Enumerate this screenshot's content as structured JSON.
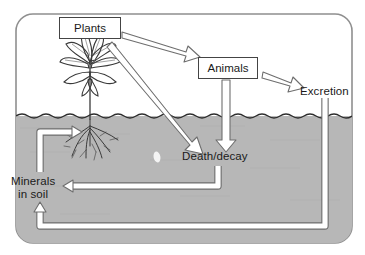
{
  "diagram": {
    "colors": {
      "soil": "#b7b7b7",
      "sky": "#ffffff",
      "frame": "#8a8a8a",
      "outline": "#4a4a4a",
      "text": "#1a1a1a",
      "arrow_fill": "#ffffff",
      "arrow_stroke": "#6e6e6e"
    },
    "nodes": [
      {
        "id": "plants",
        "label": "Plants",
        "type": "box",
        "x": 59,
        "y": 17,
        "w": 62,
        "h": 22
      },
      {
        "id": "animals",
        "label": "Animals",
        "type": "box",
        "x": 198,
        "y": 57,
        "w": 60,
        "h": 22
      },
      {
        "id": "excretion",
        "label": "Excretion",
        "type": "plain",
        "x": 300,
        "y": 85
      },
      {
        "id": "death",
        "label": "Death/decay",
        "type": "plain",
        "x": 182,
        "y": 150
      },
      {
        "id": "minerals",
        "label": "Minerals\nin soil",
        "line1": "Minerals",
        "line2": "in soil",
        "type": "plain",
        "x": 11,
        "y": 175
      }
    ],
    "edges": [
      {
        "id": "plants-to-animals",
        "from": "plants",
        "to": "animals",
        "style": "open-arrow-diagonal"
      },
      {
        "id": "plants-to-death",
        "from": "plants",
        "to": "death",
        "style": "open-arrow-diagonal"
      },
      {
        "id": "animals-to-death",
        "from": "animals",
        "to": "death",
        "style": "open-arrow-vertical"
      },
      {
        "id": "animals-to-excretion",
        "from": "animals",
        "to": "excretion",
        "style": "open-arrow-diagonal"
      },
      {
        "id": "death-to-minerals",
        "from": "death",
        "to": "minerals",
        "style": "pipe-arrow"
      },
      {
        "id": "excretion-to-minerals",
        "from": "excretion",
        "to": "minerals",
        "style": "pipe-arrow"
      },
      {
        "id": "minerals-to-roots",
        "from": "minerals",
        "to": "plant-roots",
        "style": "pipe-arrow"
      }
    ],
    "illustration": {
      "plant_label": "plant-with-roots",
      "soil_line_label": "soil-surface-line",
      "ground_label": "soil-ground"
    }
  }
}
